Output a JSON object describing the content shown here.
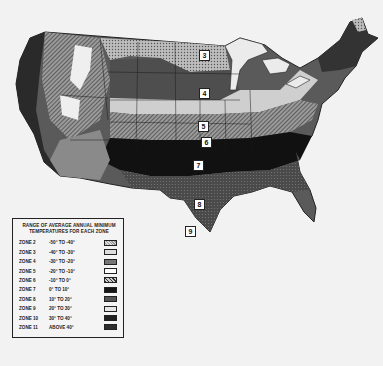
{
  "map": {
    "subject": "USDA plant hardiness zones, contiguous United States",
    "zone_markers": [
      {
        "id": "3",
        "region": "northern Minnesota"
      },
      {
        "id": "4",
        "region": "southern Minnesota / South Dakota"
      },
      {
        "id": "5",
        "region": "central plains"
      },
      {
        "id": "6",
        "region": "Kansas / Missouri"
      },
      {
        "id": "7",
        "region": "Oklahoma / Texas panhandle"
      },
      {
        "id": "8",
        "region": "central Texas"
      },
      {
        "id": "9",
        "region": "south Texas"
      }
    ],
    "colors": {
      "background": "#f2f2f2",
      "darkest": "#111111",
      "outline": "#222222"
    }
  },
  "legend": {
    "title_line1": "RANGE OF AVERAGE ANNUAL MINIMUM",
    "title_line2": "TEMPERATURES FOR EACH ZONE",
    "rows": [
      {
        "zone": "ZONE 2",
        "range": "-50° TO -40°",
        "pattern": "light-crosshatch"
      },
      {
        "zone": "ZONE 3",
        "range": "-40° TO -30°",
        "pattern": "light-dots"
      },
      {
        "zone": "ZONE 4",
        "range": "-30° TO -20°",
        "pattern": "dark-gray"
      },
      {
        "zone": "ZONE 5",
        "range": "-20° TO -10°",
        "pattern": "white"
      },
      {
        "zone": "ZONE 6",
        "range": "-10° TO 0°",
        "pattern": "diagonal-hatch"
      },
      {
        "zone": "ZONE 7",
        "range": "0° TO 10°",
        "pattern": "black"
      },
      {
        "zone": "ZONE 8",
        "range": "10° TO 20°",
        "pattern": "mid-gray-dots"
      },
      {
        "zone": "ZONE 9",
        "range": "20° TO 30°",
        "pattern": "light-gray"
      },
      {
        "zone": "ZONE 10",
        "range": "30° TO 40°",
        "pattern": "near-black"
      },
      {
        "zone": "ZONE 11",
        "range": "ABOVE 40°",
        "pattern": "dark-solid"
      }
    ]
  }
}
